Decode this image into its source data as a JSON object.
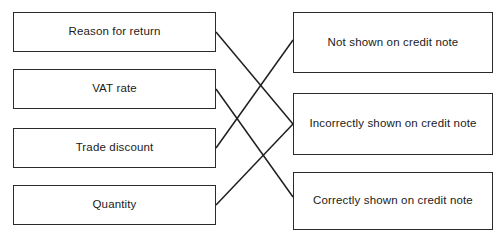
{
  "diagram": {
    "type": "matching-exercise",
    "title": "",
    "left_column": {
      "name": "items",
      "boxes": [
        {
          "id": "reason-for-return",
          "label": "Reason for return",
          "x": 13,
          "y": 12,
          "width": 203,
          "height": 40
        },
        {
          "id": "vat-rate",
          "label": "VAT rate",
          "x": 13,
          "y": 69,
          "width": 203,
          "height": 40
        },
        {
          "id": "trade-discount",
          "label": "Trade discount",
          "x": 13,
          "y": 128,
          "width": 203,
          "height": 40
        },
        {
          "id": "quantity",
          "label": "Quantity",
          "x": 13,
          "y": 185,
          "width": 203,
          "height": 40
        }
      ]
    },
    "right_column": {
      "name": "outcomes",
      "boxes": [
        {
          "id": "not-shown",
          "label": "Not shown on credit note",
          "x": 293,
          "y": 12,
          "width": 200,
          "height": 61
        },
        {
          "id": "incorrectly-shown",
          "label": "Incorrectly shown on credit note",
          "x": 293,
          "y": 93,
          "width": 200,
          "height": 62
        },
        {
          "id": "correctly-shown",
          "label": "Correctly shown on credit note",
          "x": 293,
          "y": 172,
          "width": 200,
          "height": 58
        }
      ]
    },
    "connections": [
      {
        "from": "reason-for-return",
        "to": "incorrectly-shown",
        "x1": 216,
        "y1": 32,
        "x2": 293,
        "y2": 124
      },
      {
        "from": "vat-rate",
        "to": "correctly-shown",
        "x1": 216,
        "y1": 89,
        "x2": 293,
        "y2": 197
      },
      {
        "from": "trade-discount",
        "to": "not-shown",
        "x1": 216,
        "y1": 148,
        "x2": 293,
        "y2": 40
      },
      {
        "from": "quantity",
        "to": "incorrectly-shown",
        "x1": 216,
        "y1": 205,
        "x2": 293,
        "y2": 124
      }
    ],
    "colors": {
      "border": "#2b2b2b",
      "line": "#1f1f1f",
      "text": "#1b1b1b",
      "background": "#ffffff"
    }
  }
}
